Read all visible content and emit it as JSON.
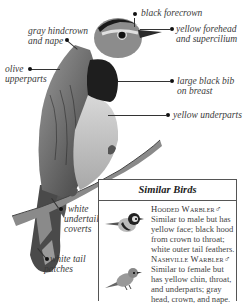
{
  "labels": {
    "black_forecrown": "black forecrown",
    "yellow_forehead_line1": "yellow forehead",
    "yellow_forehead_line2": "and supercilium",
    "gray_hindcrown_line1": "gray hindcrown",
    "gray_hindcrown_line2": "and nape",
    "olive_line1": "olive",
    "olive_line2": "upperparts",
    "bib_line1": "large black bib",
    "bib_line2": "on breast",
    "yellow_underparts": "yellow underparts",
    "undertail_line1": "white",
    "undertail_line2": "undertail",
    "undertail_line3": "coverts",
    "tail_line1": "white tail",
    "tail_line2": "patches"
  },
  "similar_birds": {
    "title": "Similar Birds",
    "entries": [
      {
        "name": "Hooded Warbler",
        "sex_symbol": "♂",
        "lines": [
          "Similar to male but has",
          "yellow face; black hood",
          "from crown to throat;",
          "white outer tail feathers."
        ]
      },
      {
        "name": "Nashville Warbler",
        "sex_symbol": "♂",
        "lines": [
          "Similar to female but",
          "has yellow chin, throat,",
          "and underparts; gray",
          "head, crown, and nape."
        ]
      }
    ]
  }
}
